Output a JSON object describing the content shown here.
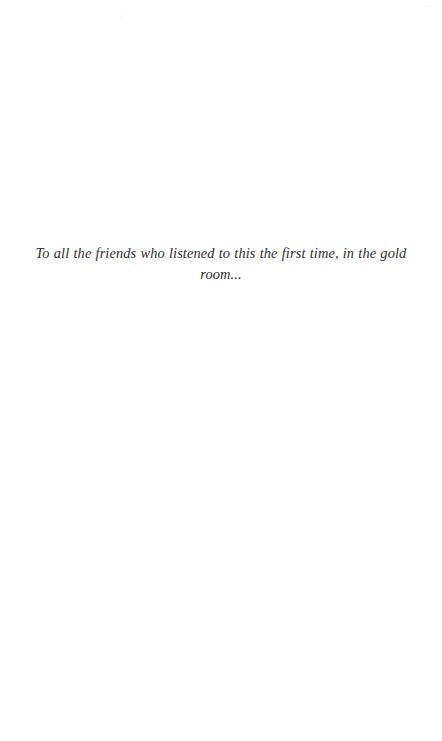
{
  "page": {
    "kind": "book-dedication-page",
    "background_color": "#ffffff",
    "width": 442,
    "height": 741
  },
  "dedication": {
    "text": "To all the friends who listened to this the first time, in the gold room...",
    "alignment": "center",
    "style": "italic",
    "text_color": "#2f2f33"
  }
}
